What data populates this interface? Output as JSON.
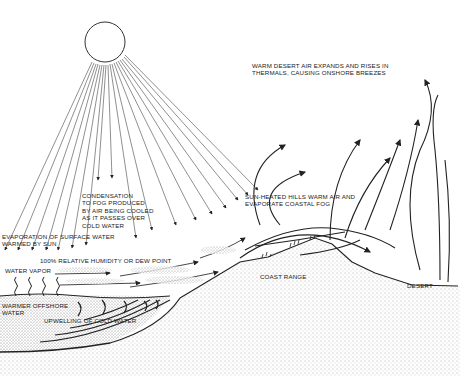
{
  "diagram": {
    "labels": {
      "desert_air": "WARM DESERT AIR EXPANDS AND RISES IN\nTHERMALS, CAUSING ONSHORE BREEZES",
      "condensation": "CONDENSATION\nTO FOG PRODUCED\nBY AIR BEING COOLED\nAS IT PASSES OVER\nCOLD WATER",
      "sun_heated": "SUN-HEATED HILLS WARM AIR AND\nEVAPORATE COASTAL FOG",
      "evaporation": "EVAPORATION OF SURFACE WATER\nWARMED BY SUN",
      "humidity": "100% RELATIVE HUMIDITY OR DEW POINT",
      "water_vapor": "WATER VAPOR",
      "warmer_offshore": "WARMER OFFSHORE\nWATER",
      "upwelling": "UPWELLING OF COLD WATER",
      "coast_range": "COAST RANGE",
      "desert": "DESERT"
    },
    "colors": {
      "line": "#222222",
      "background": "#ffffff",
      "stipple": "#9a9a9a"
    }
  }
}
